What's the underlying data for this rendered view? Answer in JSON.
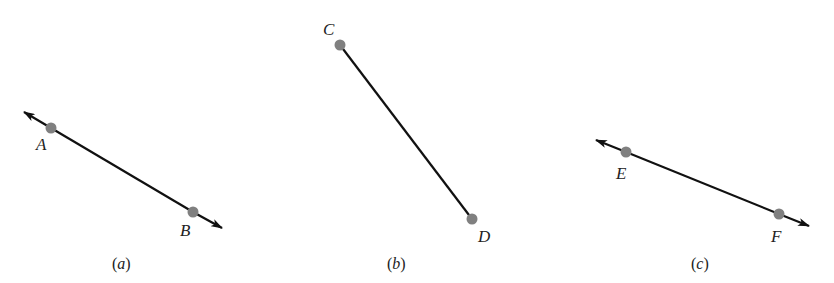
{
  "colors": {
    "line": "#111111",
    "point": "#808080",
    "text": "#222222",
    "background": "#ffffff"
  },
  "panels": [
    {
      "caption": "(a)",
      "type": "line",
      "points": [
        {
          "label": "A",
          "x": 51,
          "y": 128,
          "label_x": 36,
          "label_y": 150
        },
        {
          "label": "B",
          "x": 193,
          "y": 212,
          "label_x": 180,
          "label_y": 236
        }
      ],
      "arrow_start": {
        "x": 24,
        "y": 112
      },
      "arrow_end": {
        "x": 222,
        "y": 228
      },
      "caption_x": 122,
      "caption_y": 269
    },
    {
      "caption": "(b)",
      "type": "segment",
      "points": [
        {
          "label": "C",
          "x": 340,
          "y": 45,
          "label_x": 323,
          "label_y": 35
        },
        {
          "label": "D",
          "x": 472,
          "y": 219,
          "label_x": 478,
          "label_y": 242
        }
      ],
      "caption_x": 397,
      "caption_y": 269
    },
    {
      "caption": "(c)",
      "type": "line",
      "points": [
        {
          "label": "E",
          "x": 626,
          "y": 152,
          "label_x": 616,
          "label_y": 179
        },
        {
          "label": "F",
          "x": 779,
          "y": 214,
          "label_x": 771,
          "label_y": 242
        }
      ],
      "arrow_start": {
        "x": 596,
        "y": 140
      },
      "arrow_end": {
        "x": 809,
        "y": 226
      },
      "caption_x": 700,
      "caption_y": 269
    }
  ]
}
